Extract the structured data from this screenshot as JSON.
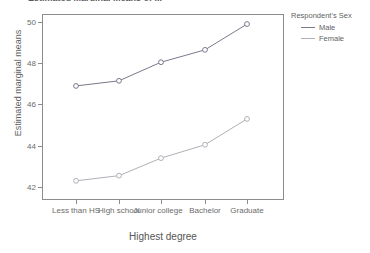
{
  "title_fragment": "Estimated Marginal Means of ...",
  "chart_data": {
    "type": "line",
    "title": "",
    "xlabel": "Highest degree",
    "ylabel": "Estimated marginal means",
    "categories": [
      "Less than HS",
      "High school",
      "Junior college",
      "Bachelor",
      "Graduate"
    ],
    "ylim": [
      41.2,
      50.5
    ],
    "yticks": [
      42,
      44,
      46,
      48,
      50
    ],
    "ytick_labels": [
      "42",
      "44",
      "46",
      "48",
      "50"
    ],
    "grid": false,
    "legend_position": "right",
    "legend_title": "Respondent's Sex",
    "markers": "open-circle",
    "series": [
      {
        "name": "Male",
        "color": "#7a7a8c",
        "values": [
          46.9,
          47.15,
          48.05,
          48.65,
          49.9
        ]
      },
      {
        "name": "Female",
        "color": "#b0b0b8",
        "values": [
          42.3,
          42.55,
          43.4,
          44.05,
          45.3
        ]
      }
    ]
  },
  "axis": {
    "frame_color": "#8c8c8c",
    "tick_color": "#8c8c8c",
    "label_color": "#6b6b6b"
  },
  "y_labels": [
    {
      "text": "50"
    },
    {
      "text": "48"
    },
    {
      "text": "46"
    },
    {
      "text": "44"
    },
    {
      "text": "42"
    }
  ],
  "x_labels": [
    {
      "text": "Less than HS"
    },
    {
      "text": "High school"
    },
    {
      "text": "Junior college"
    },
    {
      "text": "Bachelor"
    },
    {
      "text": "Graduate"
    }
  ],
  "legend": {
    "title": "Respondent's Sex",
    "items": [
      {
        "label": "Male",
        "color": "#7a7a8c"
      },
      {
        "label": "Female",
        "color": "#b0b0b8"
      }
    ]
  }
}
